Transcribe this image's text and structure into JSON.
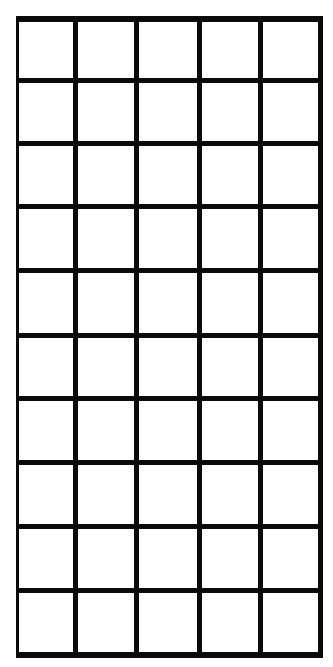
{
  "grid": {
    "rows": 10,
    "columns": 5,
    "line_color": "#0a0a0a",
    "background": "#ffffff",
    "vertical_lines": [
      {
        "x": 16,
        "w": 3
      },
      {
        "x": 73,
        "w": 5
      },
      {
        "x": 134,
        "w": 5
      },
      {
        "x": 197,
        "w": 5
      },
      {
        "x": 258,
        "w": 5
      },
      {
        "x": 318,
        "w": 5
      }
    ],
    "horizontal_lines": [
      {
        "y": 16,
        "h": 6
      },
      {
        "y": 78,
        "h": 5
      },
      {
        "y": 141,
        "h": 5
      },
      {
        "y": 204,
        "h": 5
      },
      {
        "y": 268,
        "h": 5
      },
      {
        "y": 333,
        "h": 5
      },
      {
        "y": 396,
        "h": 5
      },
      {
        "y": 460,
        "h": 5
      },
      {
        "y": 524,
        "h": 5
      },
      {
        "y": 588,
        "h": 5
      },
      {
        "y": 652,
        "h": 6
      }
    ]
  }
}
